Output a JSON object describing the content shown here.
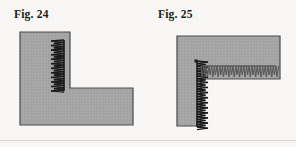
{
  "page": {
    "background_color": "#fbfaf8",
    "width": 296,
    "height": 147
  },
  "figures": [
    {
      "id": "fig-24",
      "caption": "Fig. 24",
      "description": "L-shaped block with vertical stitched seam at inner corner",
      "block": {
        "fill_color": "#a8a8a8",
        "stroke_color": "#4a4a4a",
        "shape": "L-shape",
        "outline_points": "20,32 70,32 70,88 133,88 133,125 20,125",
        "vertices": [
          {
            "x": 20,
            "y": 32
          },
          {
            "x": 70,
            "y": 32
          },
          {
            "x": 70,
            "y": 88
          },
          {
            "x": 133,
            "y": 88
          },
          {
            "x": 133,
            "y": 125
          },
          {
            "x": 20,
            "y": 125
          }
        ]
      },
      "seams": [
        {
          "name": "vertical-seam",
          "orientation": "vertical",
          "color": "#1a1a1a",
          "spine_x": 64,
          "start_y": 40,
          "end_y": 90,
          "stitch_count": 22,
          "stitch_length": 13,
          "stitch_direction": "left",
          "has_end_dot": true,
          "end_dot": {
            "x": 63,
            "y": 90,
            "size": 3
          }
        }
      ]
    },
    {
      "id": "fig-25",
      "caption": "Fig. 25",
      "description": "Rotated L-shaped block with stitched seams on vertical and horizontal inner edges",
      "block": {
        "fill_color": "#a8a8a8",
        "stroke_color": "#4a4a4a",
        "shape": "L-shape-rotated",
        "outline_points": "29,36 132,36 132,79 53,79 53,126 29,126",
        "vertices": [
          {
            "x": 29,
            "y": 36
          },
          {
            "x": 132,
            "y": 36
          },
          {
            "x": 132,
            "y": 79
          },
          {
            "x": 53,
            "y": 79
          },
          {
            "x": 53,
            "y": 126
          },
          {
            "x": 29,
            "y": 126
          }
        ]
      },
      "seams": [
        {
          "name": "vertical-seam",
          "orientation": "vertical",
          "color": "#1a1a1a",
          "spine_x": 49,
          "start_y": 61,
          "end_y": 127,
          "stitch_count": 26,
          "stitch_length": 11,
          "stitch_direction": "right",
          "has_end_dot": true,
          "end_dot": {
            "x": 48,
            "y": 61,
            "size": 3
          }
        },
        {
          "name": "horizontal-seam",
          "orientation": "horizontal",
          "color": "#5a5a5a",
          "spine_y": 66,
          "start_x": 53,
          "end_x": 128,
          "stitch_count": 28,
          "stitch_length": 11,
          "stitch_direction": "down",
          "has_end_dot": false
        }
      ]
    }
  ]
}
